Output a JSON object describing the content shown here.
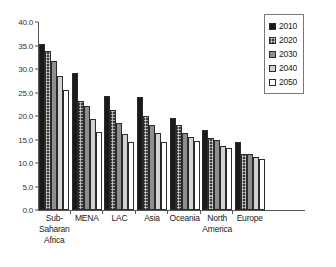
{
  "chart_data": {
    "type": "bar",
    "title": "",
    "xlabel": "",
    "ylabel": "",
    "ylim": [
      0.0,
      40.0
    ],
    "ytick_labels": [
      "40.0",
      "35.0",
      "30.0",
      "25.0",
      "20.0",
      "15.0",
      "10.0",
      "5.0",
      "0.0"
    ],
    "ytick_values": [
      40.0,
      35.0,
      30.0,
      25.0,
      20.0,
      15.0,
      10.0,
      5.0,
      0.0
    ],
    "grid": false,
    "legend_position": "top-right",
    "categories": [
      "Sub-\nSaharan\nAfrica",
      "MENA",
      "LAC",
      "Asia",
      "Oceania",
      "North\nAmerica",
      "Europe"
    ],
    "series": [
      {
        "name": "2010",
        "color": "#1a1a1a",
        "values": [
          35.3,
          29.2,
          24.3,
          24.1,
          19.6,
          17.1,
          14.5
        ]
      },
      {
        "name": "2020",
        "color": "#3a3a3a",
        "values": [
          33.8,
          23.3,
          21.2,
          20.1,
          18.1,
          15.4,
          11.9
        ]
      },
      {
        "name": "2030",
        "color": "#8e8e8e",
        "values": [
          31.8,
          22.1,
          18.6,
          18.0,
          16.4,
          14.9,
          11.9
        ]
      },
      {
        "name": "2040",
        "color": "#d2d2d2",
        "values": [
          28.6,
          19.3,
          16.2,
          16.4,
          15.5,
          13.7,
          11.2
        ]
      },
      {
        "name": "2050",
        "color": "#ffffff",
        "values": [
          25.5,
          16.7,
          14.5,
          14.5,
          14.7,
          13.2,
          10.8
        ]
      }
    ]
  },
  "legend": {
    "items": [
      {
        "label": "2010"
      },
      {
        "label": "2020"
      },
      {
        "label": "2030"
      },
      {
        "label": "2040"
      },
      {
        "label": "2050"
      }
    ]
  }
}
